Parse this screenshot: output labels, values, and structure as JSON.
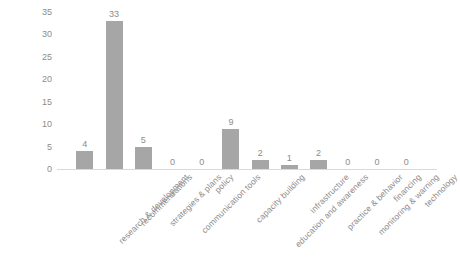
{
  "chart_data": {
    "type": "bar",
    "title": "",
    "xlabel": "",
    "ylabel": "",
    "ylim": [
      0,
      35
    ],
    "yticks": [
      0,
      5,
      10,
      15,
      20,
      25,
      30,
      35
    ],
    "grid": false,
    "legend": null,
    "bar_color": "#a6a6a6",
    "label_color": "#8c8c8c",
    "axis_color": "#d9d9d9",
    "data_labels_shown": true,
    "categories": [
      "research & development",
      "recommendations",
      "strategies & plans",
      "communication tools",
      "policy",
      "capacity building",
      "education and awareness",
      "infrastructure",
      "practice & behavior",
      "monitoring & warning",
      "financing",
      "technology"
    ],
    "values": [
      4,
      33,
      5,
      0,
      0,
      9,
      2,
      1,
      2,
      0,
      0,
      0
    ]
  },
  "yaxis": {
    "ticks": [
      "0",
      "5",
      "10",
      "15",
      "20",
      "25",
      "30",
      "35"
    ]
  },
  "title_sliver": ""
}
